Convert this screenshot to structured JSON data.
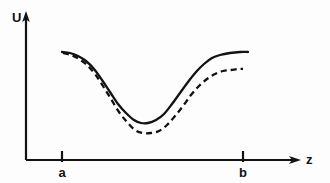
{
  "figure": {
    "background_color": "#fdfdfd",
    "ink_color": "#121212",
    "width": 330,
    "height": 183
  },
  "axes": {
    "y_axis": {
      "label": "U",
      "name": "potential-energy",
      "origin_x": 26,
      "top_y": 12,
      "bottom_y": 160,
      "arrow": "up-arrow-icon"
    },
    "x_axis": {
      "label": "z",
      "name": "coordinate",
      "origin_x": 26,
      "baseline_y": 160,
      "tip_x": 300,
      "arrow": "right-arrow-icon"
    },
    "ticks": [
      {
        "label": "a",
        "x": 62,
        "y_top": 152,
        "y_bottom": 163
      },
      {
        "label": "b",
        "x": 243,
        "y_top": 152,
        "y_bottom": 163
      }
    ]
  },
  "chart_data": {
    "type": "line",
    "title": "",
    "xlabel": "z",
    "ylabel": "U",
    "grid": false,
    "legend": "none",
    "xlim": [
      26,
      300
    ],
    "ylim": [
      160,
      12
    ],
    "x_tick_labels": [
      "a",
      "b"
    ],
    "x_tick_values": [
      62,
      243
    ],
    "annotations": [],
    "series": [
      {
        "name": "solid-potential-curve",
        "style": "solid",
        "color": "#121212",
        "line_width": 2.3,
        "points": [
          [
            62,
            52
          ],
          [
            70,
            53
          ],
          [
            78,
            56
          ],
          [
            86,
            61
          ],
          [
            94,
            69
          ],
          [
            102,
            80
          ],
          [
            110,
            92
          ],
          [
            118,
            104
          ],
          [
            126,
            113
          ],
          [
            134,
            120
          ],
          [
            141,
            123
          ],
          [
            148,
            123
          ],
          [
            156,
            120
          ],
          [
            164,
            114
          ],
          [
            172,
            104
          ],
          [
            180,
            93
          ],
          [
            188,
            82
          ],
          [
            196,
            72
          ],
          [
            204,
            64
          ],
          [
            212,
            58
          ],
          [
            220,
            55
          ],
          [
            230,
            53
          ],
          [
            240,
            52
          ],
          [
            248,
            52
          ]
        ]
      },
      {
        "name": "dashed-potential-curve",
        "style": "dashed",
        "color": "#121212",
        "line_width": 2.3,
        "dash_pattern": "6 4",
        "points": [
          [
            63,
            53
          ],
          [
            71,
            55
          ],
          [
            79,
            59
          ],
          [
            87,
            65
          ],
          [
            95,
            74
          ],
          [
            103,
            86
          ],
          [
            111,
            99
          ],
          [
            119,
            112
          ],
          [
            127,
            122
          ],
          [
            135,
            130
          ],
          [
            143,
            133
          ],
          [
            151,
            133
          ],
          [
            159,
            131
          ],
          [
            167,
            125
          ],
          [
            175,
            116
          ],
          [
            183,
            106
          ],
          [
            191,
            95
          ],
          [
            199,
            86
          ],
          [
            207,
            79
          ],
          [
            215,
            74
          ],
          [
            223,
            71
          ],
          [
            231,
            70
          ],
          [
            238,
            69
          ],
          [
            243,
            69
          ]
        ]
      }
    ]
  }
}
